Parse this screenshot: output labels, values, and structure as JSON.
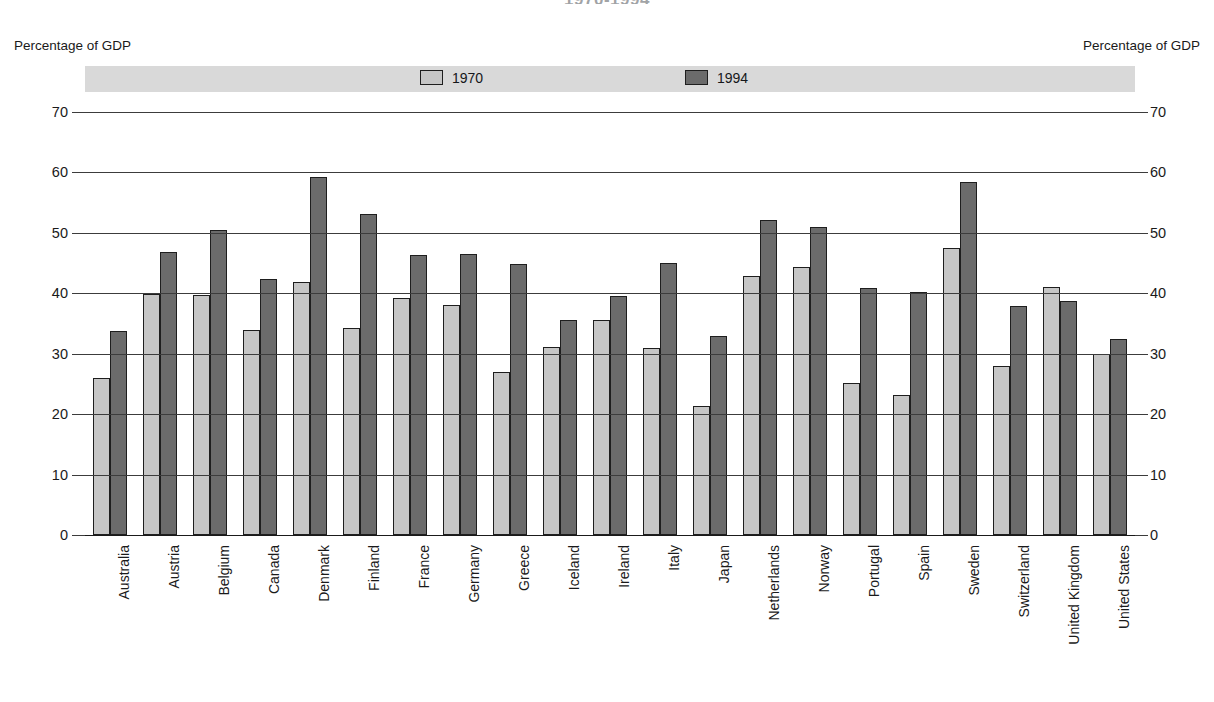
{
  "chart_data": {
    "type": "bar",
    "title": "1970-1994",
    "xlabel": "",
    "ylabel": "Percentage of GDP",
    "ylabel_right": "Percentage of GDP",
    "ylim": [
      0,
      70
    ],
    "yticks": [
      0,
      10,
      20,
      30,
      40,
      50,
      60,
      70
    ],
    "grid": true,
    "legend_position": "top",
    "categories": [
      "Australia",
      "Austria",
      "Belgium",
      "Canada",
      "Denmark",
      "Finland",
      "France",
      "Germany",
      "Greece",
      "Iceland",
      "Ireland",
      "Italy",
      "Japan",
      "Netherlands",
      "Norway",
      "Portugal",
      "Spain",
      "Sweden",
      "Switzerland",
      "United Kingdom",
      "United States"
    ],
    "series": [
      {
        "name": "1970",
        "color": "#c6c6c6",
        "values": [
          26.0,
          39.9,
          39.7,
          34.0,
          41.8,
          34.2,
          39.2,
          38.0,
          27.0,
          31.1,
          35.6,
          31.0,
          21.4,
          42.8,
          44.3,
          25.2,
          23.1,
          47.5,
          27.9,
          41.0,
          29.9
        ]
      },
      {
        "name": "1994",
        "color": "#6b6b6b",
        "values": [
          33.7,
          46.8,
          50.5,
          42.3,
          59.2,
          53.2,
          46.4,
          46.5,
          44.8,
          35.5,
          39.5,
          45.0,
          33.0,
          52.1,
          51.0,
          40.8,
          40.2,
          58.5,
          37.9,
          38.7,
          32.4
        ]
      }
    ]
  },
  "legend": {
    "items": [
      {
        "label": "1970",
        "color": "#c6c6c6"
      },
      {
        "label": "1994",
        "color": "#6b6b6b"
      }
    ]
  },
  "axis": {
    "left_caption": "Percentage of GDP",
    "right_caption": "Percentage of GDP"
  },
  "colors": {
    "series_1970": "#c6c6c6",
    "series_1994": "#6b6b6b",
    "legend_band": "#d9d9d9",
    "gridline": "#3c3c3c",
    "text": "#1a1a1a"
  }
}
